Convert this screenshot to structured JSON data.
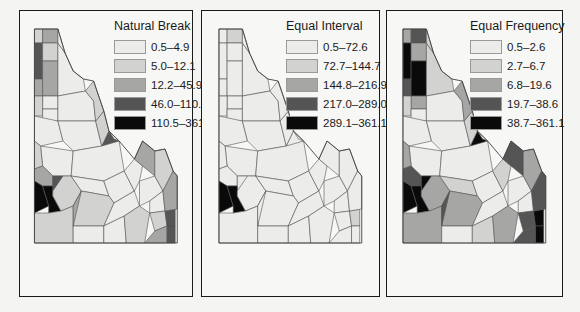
{
  "class_colors": [
    "#ececea",
    "#d2d2d0",
    "#a6a6a4",
    "#555555",
    "#0a0a0a"
  ],
  "panels": [
    {
      "title": "Natural Break",
      "classes": [
        "0.5–4.9",
        "5.0–12.1",
        "12.2–45.9",
        "46.0–110.4",
        "110.5–361.1"
      ],
      "county_classes": [
        1,
        2,
        3,
        1,
        2,
        2,
        0,
        0,
        1,
        0,
        0,
        0,
        0,
        0,
        0,
        1,
        2,
        3,
        4,
        4,
        1,
        0,
        0,
        0,
        1,
        0,
        1,
        0,
        0,
        0,
        0,
        1,
        1,
        2,
        3,
        3,
        3,
        2,
        1,
        2,
        1,
        1,
        0,
        2
      ]
    },
    {
      "title": "Equal Interval",
      "classes": [
        "0.5–72.6",
        "72.7–144.7",
        "144.8–216.9",
        "217.0–289.0",
        "289.1–361.1"
      ],
      "county_classes": [
        0,
        1,
        0,
        0,
        0,
        0,
        0,
        0,
        0,
        0,
        0,
        0,
        0,
        0,
        0,
        0,
        0,
        0,
        4,
        4,
        0,
        0,
        0,
        0,
        0,
        0,
        0,
        0,
        0,
        0,
        0,
        0,
        0,
        0,
        1,
        0,
        0,
        0,
        0,
        0,
        0,
        0,
        0,
        0
      ]
    },
    {
      "title": "Equal Frequency",
      "classes": [
        "0.5–2.6",
        "2.7–6.7",
        "6.8–19.6",
        "19.7–38.6",
        "38.7–361.1"
      ],
      "county_classes": [
        2,
        3,
        4,
        2,
        3,
        4,
        2,
        1,
        1,
        0,
        0,
        0,
        0,
        0,
        0,
        2,
        3,
        4,
        4,
        4,
        2,
        1,
        0,
        1,
        2,
        0,
        2,
        0,
        1,
        0,
        0,
        2,
        3,
        3,
        4,
        4,
        4,
        3,
        2,
        3,
        1,
        2,
        1,
        3
      ]
    }
  ]
}
